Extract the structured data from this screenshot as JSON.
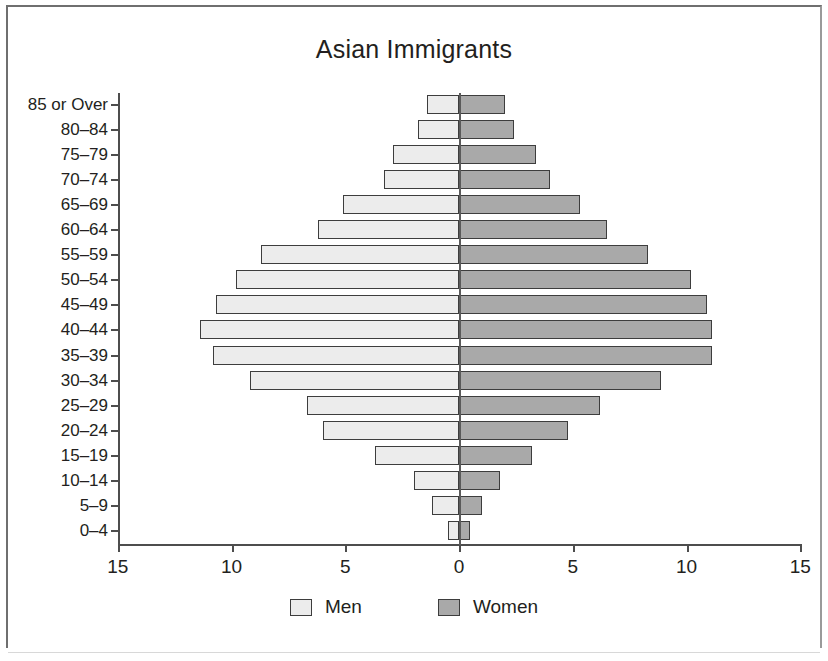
{
  "chart_data": {
    "type": "bar",
    "subtype": "population-pyramid",
    "title": "Asian Immigrants",
    "xlabel": "",
    "ylabel": "",
    "grid": false,
    "legend_position": "bottom",
    "xlim": [
      -15,
      15
    ],
    "x_tick_labels": [
      "15",
      "10",
      "5",
      "0",
      "5",
      "10",
      "15"
    ],
    "x_tick_values": [
      -15,
      -10,
      -5,
      0,
      5,
      10,
      15
    ],
    "categories": [
      "85 or Over",
      "80–84",
      "75–79",
      "70–74",
      "65–69",
      "60–64",
      "55–59",
      "50–54",
      "45–49",
      "40–44",
      "35–39",
      "30–34",
      "25–29",
      "20–24",
      "15–19",
      "10–14",
      "5–9",
      "0–4"
    ],
    "series": [
      {
        "name": "Men",
        "color": "#ececec",
        "direction": "left",
        "values": [
          1.4,
          1.8,
          2.9,
          3.3,
          5.1,
          6.2,
          8.7,
          9.8,
          10.7,
          11.4,
          10.8,
          9.2,
          6.7,
          6.0,
          3.7,
          2.0,
          1.2,
          0.5
        ]
      },
      {
        "name": "Women",
        "color": "#a9a9a9",
        "direction": "right",
        "values": [
          2.0,
          2.4,
          3.4,
          4.0,
          5.3,
          6.5,
          8.3,
          10.2,
          10.9,
          11.1,
          11.1,
          8.9,
          6.2,
          4.8,
          3.2,
          1.8,
          1.0,
          0.5
        ]
      }
    ]
  },
  "legend": {
    "items": [
      {
        "label": "Men",
        "color": "#ececec"
      },
      {
        "label": "Women",
        "color": "#a9a9a9"
      }
    ]
  }
}
